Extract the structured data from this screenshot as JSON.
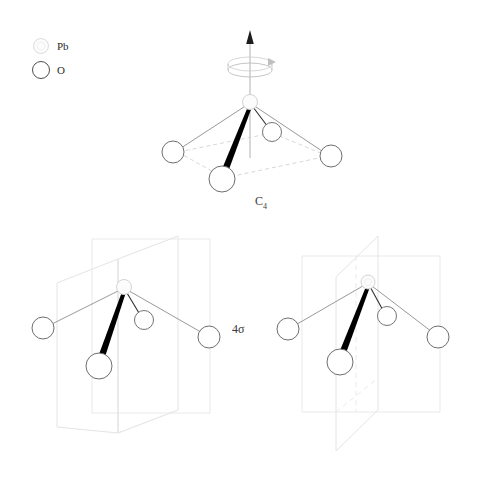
{
  "figure": {
    "title": "",
    "background_color": "#ffffff",
    "legend": {
      "items": [
        {
          "symbol": "Pb",
          "label": "Pb",
          "fill": "#fbfbfb",
          "stroke": "#d9d9d9",
          "radius": 7
        },
        {
          "symbol": "O",
          "label": "O",
          "fill": "#ffffff",
          "stroke": "#4a4a4a",
          "radius": 8
        }
      ]
    },
    "panels": [
      {
        "id": "c4-panel",
        "operation_label": "C",
        "operation_subscript": "4",
        "operation_full": "C4",
        "description": "square pyramidal PbO4 with C4 principal rotation axis",
        "axis": {
          "visible": true,
          "arrow": true,
          "rotation_ellipse": true
        },
        "planes": []
      },
      {
        "id": "sigma-left-panel",
        "operation_label": "4",
        "operation_subscript": "",
        "operation_full": "4sigma",
        "description": "square pyramidal PbO4 with two vertical mirror planes",
        "axis": {
          "visible": false,
          "arrow": false,
          "rotation_ellipse": false
        },
        "planes": [
          "sigma-v-front",
          "sigma-v-side"
        ]
      },
      {
        "id": "sigma-right-panel",
        "operation_label": "",
        "operation_subscript": "",
        "operation_full": "4sigma",
        "description": "square pyramidal PbO4 with two diagonal mirror planes",
        "axis": {
          "visible": false,
          "arrow": false,
          "rotation_ellipse": false
        },
        "planes": [
          "sigma-d-front",
          "sigma-d-diagonal"
        ]
      }
    ],
    "labels": {
      "c4": "C",
      "c4_sub": "4",
      "sigma": "4σ"
    },
    "colors": {
      "bond": "#8a8a8a",
      "bond_wedge": "#000000",
      "base_dashed": "#cfcfcf",
      "plane_stroke": "#e2e2e2",
      "plane_dashed": "#e8e8e8",
      "axis": "#9a9a9a",
      "oxygen_stroke": "#6b6b6b",
      "lead_stroke": "#d5d5d5",
      "text": "#2b2b2b"
    },
    "atoms": {
      "lead_label": "Pb",
      "oxygen_label": "O",
      "oxygen_count": 4
    }
  }
}
